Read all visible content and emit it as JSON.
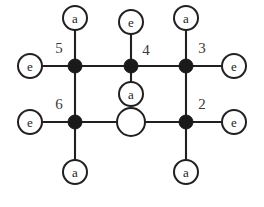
{
  "figure": {
    "background_color": "#ffffff",
    "line_color": "#231f20",
    "node_fill_color": "#1a1a1a",
    "label_color": "#3a3a3a",
    "width": 264,
    "height": 207
  },
  "ring_vertices": [
    {
      "id": "v5",
      "index_label": "5",
      "x": 75,
      "y": 66,
      "style": "filled",
      "radius": 7
    },
    {
      "id": "v4",
      "index_label": "4",
      "x": 131,
      "y": 66,
      "style": "filled",
      "radius": 7
    },
    {
      "id": "v3",
      "index_label": "3",
      "x": 186,
      "y": 66,
      "style": "filled",
      "radius": 7
    },
    {
      "id": "v6",
      "index_label": "6",
      "x": 75,
      "y": 122,
      "style": "filled",
      "radius": 7
    },
    {
      "id": "v1",
      "index_label": "",
      "x": 131,
      "y": 122,
      "style": "open",
      "radius": 14
    },
    {
      "id": "v2",
      "index_label": "2",
      "x": 186,
      "y": 122,
      "style": "filled",
      "radius": 7
    }
  ],
  "index_labels": [
    {
      "text": "5",
      "x": 59,
      "y": 48
    },
    {
      "text": "4",
      "x": 146,
      "y": 50
    },
    {
      "text": "3",
      "x": 202,
      "y": 48
    },
    {
      "text": "6",
      "x": 59,
      "y": 104
    },
    {
      "text": "2",
      "x": 202,
      "y": 104
    }
  ],
  "ring_bonds": [
    {
      "from": "v5",
      "to": "v4"
    },
    {
      "from": "v4",
      "to": "v3"
    },
    {
      "from": "v5",
      "to": "v6"
    },
    {
      "from": "v3",
      "to": "v2"
    },
    {
      "from": "v6",
      "to": "v1"
    },
    {
      "from": "v1",
      "to": "v2"
    }
  ],
  "substituents": [
    {
      "id": "s-v5-axial",
      "label": "a",
      "attached_to": "v5",
      "direction": "up",
      "x": 75,
      "y": 18,
      "radius": 12
    },
    {
      "id": "s-v5-equatorial",
      "label": "e",
      "attached_to": "v5",
      "direction": "left",
      "x": 30,
      "y": 66,
      "radius": 12
    },
    {
      "id": "s-v4-equatorial",
      "label": "e",
      "attached_to": "v4",
      "direction": "up",
      "x": 131,
      "y": 22,
      "radius": 12
    },
    {
      "id": "s-v4-axial",
      "label": "a",
      "attached_to": "v4",
      "direction": "down",
      "x": 131,
      "y": 94,
      "radius": 12
    },
    {
      "id": "s-v3-axial",
      "label": "a",
      "attached_to": "v3",
      "direction": "up",
      "x": 186,
      "y": 18,
      "radius": 12
    },
    {
      "id": "s-v3-equatorial",
      "label": "e",
      "attached_to": "v3",
      "direction": "right",
      "x": 234,
      "y": 66,
      "radius": 12
    },
    {
      "id": "s-v6-equatorial",
      "label": "e",
      "attached_to": "v6",
      "direction": "left",
      "x": 30,
      "y": 122,
      "radius": 12
    },
    {
      "id": "s-v6-axial",
      "label": "a",
      "attached_to": "v6",
      "direction": "down",
      "x": 75,
      "y": 172,
      "radius": 12
    },
    {
      "id": "s-v2-equatorial",
      "label": "e",
      "attached_to": "v2",
      "direction": "right",
      "x": 234,
      "y": 122,
      "radius": 12
    },
    {
      "id": "s-v2-axial",
      "label": "a",
      "attached_to": "v2",
      "direction": "down",
      "x": 186,
      "y": 172,
      "radius": 12
    }
  ],
  "legend": {
    "axial_symbol": "a",
    "equatorial_symbol": "e"
  }
}
